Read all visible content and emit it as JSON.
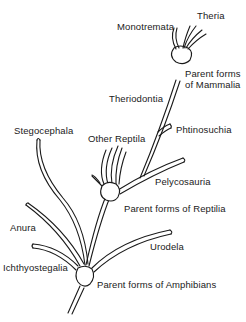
{
  "diagram": {
    "type": "phylogenetic-tree",
    "background": "#ffffff",
    "ink": "#1a1a1a",
    "labels": {
      "theria": "Theria",
      "monotremata": "Monotremata",
      "parent_mammalia_1": "Parent forms",
      "parent_mammalia_2": "of Mammalia",
      "theriodontia": "Theriodontia",
      "phtinosuchia": "Phtinosuchia",
      "other_reptila": "Other Reptila",
      "stegocephala": "Stegocephala",
      "pelycosauria": "Pelycosauria",
      "parent_reptilia": "Parent forms of Reptilia",
      "anura": "Anura",
      "urodela": "Urodela",
      "ichthyostegalia": "Ichthyostegalia",
      "parent_amphibians": "Parent forms of Amphibians"
    },
    "nodes": [
      {
        "id": "amphibian-parent",
        "label": "Parent forms of Amphibians"
      },
      {
        "id": "reptile-parent",
        "label": "Parent forms of Reptilia"
      },
      {
        "id": "mammal-parent",
        "label": "Parent forms of Mammalia"
      }
    ],
    "edges": [
      {
        "from": "root",
        "to": "amphibian-parent"
      },
      {
        "from": "amphibian-parent",
        "to": "Ichthyostegalia"
      },
      {
        "from": "amphibian-parent",
        "to": "Anura"
      },
      {
        "from": "amphibian-parent",
        "to": "Stegocephala"
      },
      {
        "from": "amphibian-parent",
        "to": "Urodela"
      },
      {
        "from": "amphibian-parent",
        "to": "reptile-parent"
      },
      {
        "from": "reptile-parent",
        "to": "Other Reptila"
      },
      {
        "from": "reptile-parent",
        "to": "Pelycosauria"
      },
      {
        "from": "Pelycosauria",
        "to": "Phtinosuchia"
      },
      {
        "from": "Pelycosauria",
        "to": "Theriodontia"
      },
      {
        "from": "Theriodontia",
        "to": "mammal-parent"
      },
      {
        "from": "mammal-parent",
        "to": "Monotremata"
      },
      {
        "from": "mammal-parent",
        "to": "Theria"
      }
    ]
  }
}
